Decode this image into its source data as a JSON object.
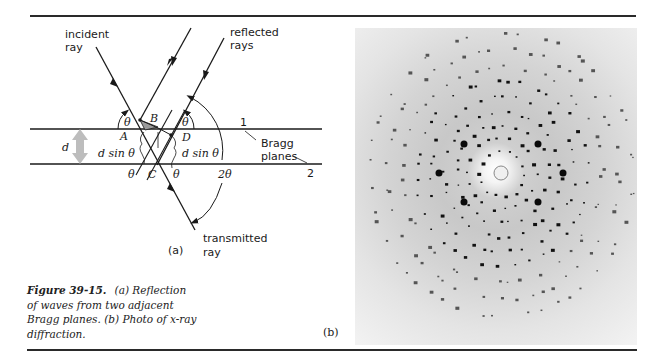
{
  "figure": {
    "number": "Figure 39-15.",
    "caption": "(a) Reflection of waves from two adjacent Bragg planes. (b) Photo of x-ray diffraction.",
    "caption_lines": [
      "(a) Reflection",
      "of waves from two adjacent",
      "Bragg planes. (b) Photo of x-ray",
      "diffraction."
    ]
  },
  "diagram_a": {
    "sublabel": "(a)",
    "labels": {
      "incident_line1": "incident",
      "incident_line2": "ray",
      "reflected_line1": "reflected",
      "reflected_line2": "rays",
      "transmitted_line1": "transmitted",
      "transmitted_line2": "ray",
      "plane1": "1",
      "plane2": "2",
      "bragg_line1": "Bragg",
      "bragg_line2": "planes",
      "point_A": "A",
      "point_B": "B",
      "point_C": "C",
      "point_D": "D",
      "spacing": "d",
      "dsin_left": "d sin θ",
      "dsin_right": "d sin θ",
      "theta_left": "θ",
      "theta_right": "θ",
      "theta_bottom_left": "θ",
      "theta_bottom_right": "θ",
      "two_theta": "2θ"
    }
  },
  "photo_b": {
    "sublabel": "(b)",
    "description": "x-ray diffraction pattern"
  }
}
